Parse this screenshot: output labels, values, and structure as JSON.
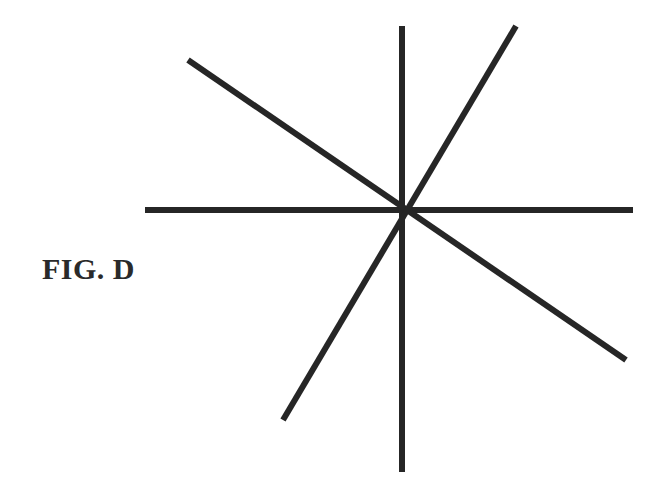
{
  "figure": {
    "label": "FIG. D",
    "stroke_color": "#262626",
    "stroke_width": 6,
    "center": [
      402,
      210
    ],
    "lines": [
      {
        "name": "vertical",
        "x1": 402,
        "y1": 26,
        "x2": 402,
        "y2": 472
      },
      {
        "name": "horizontal",
        "x1": 145,
        "y1": 210,
        "x2": 633,
        "y2": 210
      },
      {
        "name": "diagonal-down-right",
        "x1": 188,
        "y1": 60,
        "x2": 626,
        "y2": 360
      },
      {
        "name": "diagonal-up-right",
        "x1": 283,
        "y1": 420,
        "x2": 516,
        "y2": 26
      }
    ]
  }
}
